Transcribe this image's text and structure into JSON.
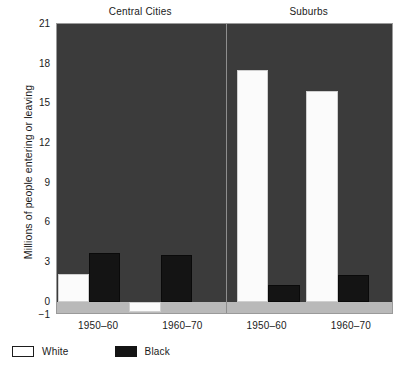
{
  "chart_data": {
    "type": "bar",
    "title": "",
    "xlabel": "",
    "ylabel": "Millions of people entering or leaving",
    "ylim": [
      -1,
      21
    ],
    "yticks": [
      21,
      18,
      15,
      12,
      9,
      6,
      3,
      0,
      -1
    ],
    "ytick_labels": [
      "21",
      "18",
      "15",
      "12",
      "9",
      "6",
      "3",
      "0",
      "−1"
    ],
    "grid": false,
    "legend_position": "below-left",
    "panels": [
      {
        "name": "Central Cities",
        "categories": [
          "1950–60",
          "1960–70"
        ],
        "series": [
          {
            "name": "White",
            "values": [
              2.1,
              -0.8
            ]
          },
          {
            "name": "Black",
            "values": [
              3.7,
              3.5
            ]
          }
        ]
      },
      {
        "name": "Suburbs",
        "categories": [
          "1950–60",
          "1960–70"
        ],
        "series": [
          {
            "name": "White",
            "values": [
              17.5,
              15.9
            ]
          },
          {
            "name": "Black",
            "values": [
              1.3,
              2.0
            ]
          }
        ]
      }
    ],
    "series_colors": {
      "White": "#ffffff",
      "Black": "#141414"
    },
    "plot_background": "#3b3b3b",
    "negative_band_color": "#b9b9b9"
  },
  "axis": {
    "y_title": "Millions of people entering or leaving",
    "y_tick_labels": [
      "21",
      "18",
      "15",
      "12",
      "9",
      "6",
      "3",
      "0",
      "−1"
    ],
    "x_tick_labels": [
      "1950–60",
      "1960–70",
      "1950–60",
      "1960–70"
    ]
  },
  "panels": {
    "left_title": "Central Cities",
    "right_title": "Suburbs"
  },
  "legend": {
    "items": [
      {
        "label": "White",
        "color": "#ffffff"
      },
      {
        "label": "Black",
        "color": "#141414"
      }
    ]
  }
}
